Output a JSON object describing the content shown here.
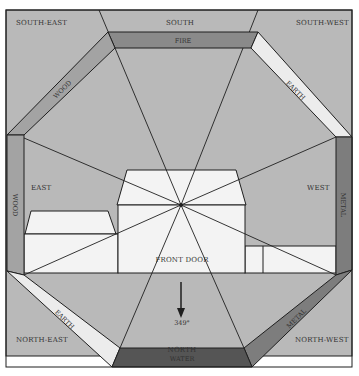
{
  "colors": {
    "background": "#ffffff",
    "zone_fill": "#b9b9b9",
    "house_fill": "#f3f3f3",
    "line": "#1f1f1f",
    "fire": "#8a8a8a",
    "wood": "#a3a3a3",
    "earth": "#ececec",
    "metal": "#7d7d7d",
    "water": "#555555"
  },
  "directions": {
    "south_east": "SOUTH-EAST",
    "south": "SOUTH",
    "south_west": "SOUTH-WEST",
    "east": "EAST",
    "west": "WEST",
    "north_east": "NORTH-EAST",
    "north": "NORTH",
    "north_west": "NORTH-WEST"
  },
  "elements": {
    "south": "FIRE",
    "south_east": "WOOD",
    "east": "WOOD",
    "south_west": "EARTH",
    "west": "METAL",
    "north_east": "EARTH",
    "north_west": "METAL",
    "north": "WATER"
  },
  "labels": {
    "front_door": "FRONT DOOR",
    "bearing": "349°"
  }
}
